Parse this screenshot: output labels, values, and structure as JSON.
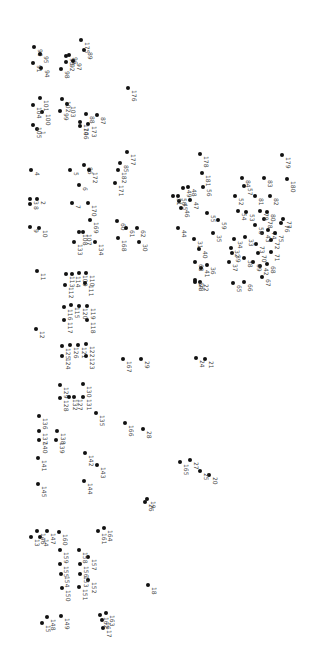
{
  "puzzle": {
    "type": "connect-the-dots",
    "orientation": "rotated-90",
    "dot_color": "#111111",
    "label_color": "#444444",
    "dots": [
      {
        "n": "1",
        "x": 37,
        "y": 129
      },
      {
        "n": "2",
        "x": 37,
        "y": 199
      },
      {
        "n": "3",
        "x": 30,
        "y": 199
      },
      {
        "n": "4",
        "x": 31,
        "y": 170
      },
      {
        "n": "5",
        "x": 70,
        "y": 170
      },
      {
        "n": "6",
        "x": 79,
        "y": 185
      },
      {
        "n": "7",
        "x": 72,
        "y": 203
      },
      {
        "n": "8",
        "x": 30,
        "y": 204
      },
      {
        "n": "9",
        "x": 30,
        "y": 227
      },
      {
        "n": "10",
        "x": 39,
        "y": 228
      },
      {
        "n": "11",
        "x": 37,
        "y": 271
      },
      {
        "n": "12",
        "x": 36,
        "y": 329
      },
      {
        "n": "13",
        "x": 31,
        "y": 537
      },
      {
        "n": "14",
        "x": 40,
        "y": 537
      },
      {
        "n": "15",
        "x": 42,
        "y": 623
      },
      {
        "n": "16",
        "x": 102,
        "y": 620
      },
      {
        "n": "17",
        "x": 103,
        "y": 628
      },
      {
        "n": "18",
        "x": 148,
        "y": 585
      },
      {
        "n": "19",
        "x": 147,
        "y": 499
      },
      {
        "n": "20",
        "x": 209,
        "y": 475
      },
      {
        "n": "21",
        "x": 205,
        "y": 359
      },
      {
        "n": "22",
        "x": 200,
        "y": 282
      },
      {
        "n": "23",
        "x": 195,
        "y": 282
      },
      {
        "n": "24",
        "x": 196,
        "y": 358
      },
      {
        "n": "25",
        "x": 200,
        "y": 471
      },
      {
        "n": "26",
        "x": 145,
        "y": 502
      },
      {
        "n": "27",
        "x": 190,
        "y": 460
      },
      {
        "n": "28",
        "x": 143,
        "y": 429
      },
      {
        "n": "29",
        "x": 141,
        "y": 359
      },
      {
        "n": "30",
        "x": 139,
        "y": 242
      },
      {
        "n": "31",
        "x": 194,
        "y": 239
      },
      {
        "n": "32",
        "x": 231,
        "y": 248
      },
      {
        "n": "33",
        "x": 245,
        "y": 237
      },
      {
        "n": "34",
        "x": 234,
        "y": 239
      },
      {
        "n": "35",
        "x": 213,
        "y": 233
      },
      {
        "n": "36",
        "x": 207,
        "y": 265
      },
      {
        "n": "37",
        "x": 229,
        "y": 262
      },
      {
        "n": "38",
        "x": 244,
        "y": 258
      },
      {
        "n": "39",
        "x": 232,
        "y": 253
      },
      {
        "n": "40",
        "x": 199,
        "y": 249
      },
      {
        "n": "41",
        "x": 201,
        "y": 268
      },
      {
        "n": "42",
        "x": 260,
        "y": 266
      },
      {
        "n": "43",
        "x": 262,
        "y": 233
      },
      {
        "n": "44",
        "x": 178,
        "y": 228
      },
      {
        "n": "45",
        "x": 179,
        "y": 201
      },
      {
        "n": "46",
        "x": 181,
        "y": 208
      },
      {
        "n": "47",
        "x": 190,
        "y": 200
      },
      {
        "n": "48",
        "x": 188,
        "y": 187
      },
      {
        "n": "49",
        "x": 183,
        "y": 188
      },
      {
        "n": "50",
        "x": 178,
        "y": 196
      },
      {
        "n": "51",
        "x": 173,
        "y": 196
      },
      {
        "n": "52",
        "x": 235,
        "y": 196
      },
      {
        "n": "53",
        "x": 246,
        "y": 212
      },
      {
        "n": "54",
        "x": 238,
        "y": 211
      },
      {
        "n": "55",
        "x": 207,
        "y": 213
      },
      {
        "n": "56",
        "x": 203,
        "y": 187
      },
      {
        "n": "57",
        "x": 244,
        "y": 186
      },
      {
        "n": "58",
        "x": 255,
        "y": 225
      },
      {
        "n": "59",
        "x": 218,
        "y": 220
      },
      {
        "n": "60",
        "x": 117,
        "y": 221
      },
      {
        "n": "61",
        "x": 126,
        "y": 228
      },
      {
        "n": "62",
        "x": 137,
        "y": 228
      },
      {
        "n": "63",
        "x": 195,
        "y": 262
      },
      {
        "n": "64",
        "x": 195,
        "y": 280
      },
      {
        "n": "65",
        "x": 233,
        "y": 283
      },
      {
        "n": "66",
        "x": 244,
        "y": 282
      },
      {
        "n": "67",
        "x": 262,
        "y": 277
      },
      {
        "n": "68",
        "x": 267,
        "y": 264
      },
      {
        "n": "69",
        "x": 253,
        "y": 262
      },
      {
        "n": "70",
        "x": 258,
        "y": 253
      },
      {
        "n": "71",
        "x": 271,
        "y": 252
      },
      {
        "n": "72",
        "x": 271,
        "y": 240
      },
      {
        "n": "73",
        "x": 256,
        "y": 244
      },
      {
        "n": "74",
        "x": 268,
        "y": 230
      },
      {
        "n": "75",
        "x": 275,
        "y": 233
      },
      {
        "n": "76",
        "x": 281,
        "y": 223
      },
      {
        "n": "77",
        "x": 283,
        "y": 219
      },
      {
        "n": "78",
        "x": 264,
        "y": 219
      },
      {
        "n": "79",
        "x": 260,
        "y": 211
      },
      {
        "n": "80",
        "x": 267,
        "y": 212
      },
      {
        "n": "81",
        "x": 255,
        "y": 196
      },
      {
        "n": "82",
        "x": 270,
        "y": 196
      },
      {
        "n": "83",
        "x": 264,
        "y": 178
      },
      {
        "n": "84",
        "x": 242,
        "y": 178
      },
      {
        "n": "85",
        "x": 120,
        "y": 163
      },
      {
        "n": "86",
        "x": 84,
        "y": 165
      },
      {
        "n": "87",
        "x": 97,
        "y": 115
      },
      {
        "n": "88",
        "x": 86,
        "y": 114
      },
      {
        "n": "89",
        "x": 84,
        "y": 50
      },
      {
        "n": "90",
        "x": 34,
        "y": 47
      },
      {
        "n": "91",
        "x": 33,
        "y": 63
      },
      {
        "n": "92",
        "x": 66,
        "y": 62
      },
      {
        "n": "93",
        "x": 66,
        "y": 56
      },
      {
        "n": "94",
        "x": 41,
        "y": 68
      },
      {
        "n": "95",
        "x": 40,
        "y": 54
      },
      {
        "n": "96",
        "x": 69,
        "y": 55
      },
      {
        "n": "97",
        "x": 73,
        "y": 61
      },
      {
        "n": "98",
        "x": 61,
        "y": 69
      },
      {
        "n": "99",
        "x": 60,
        "y": 111
      },
      {
        "n": "100",
        "x": 42,
        "y": 112
      },
      {
        "n": "101",
        "x": 40,
        "y": 98
      },
      {
        "n": "102",
        "x": 62,
        "y": 99
      },
      {
        "n": "103",
        "x": 67,
        "y": 104
      },
      {
        "n": "104",
        "x": 33,
        "y": 105
      },
      {
        "n": "105",
        "x": 33,
        "y": 125
      },
      {
        "n": "106",
        "x": 80,
        "y": 126
      },
      {
        "n": "107",
        "x": 83,
        "y": 232
      },
      {
        "n": "108",
        "x": 79,
        "y": 232
      },
      {
        "n": "109",
        "x": 79,
        "y": 273
      },
      {
        "n": "110",
        "x": 86,
        "y": 273
      },
      {
        "n": "111",
        "x": 85,
        "y": 283
      },
      {
        "n": "112",
        "x": 65,
        "y": 285
      },
      {
        "n": "113",
        "x": 66,
        "y": 274
      },
      {
        "n": "114",
        "x": 72,
        "y": 274
      },
      {
        "n": "115",
        "x": 71,
        "y": 305
      },
      {
        "n": "116",
        "x": 64,
        "y": 307
      },
      {
        "n": "117",
        "x": 64,
        "y": 320
      },
      {
        "n": "118",
        "x": 87,
        "y": 320
      },
      {
        "n": "119",
        "x": 87,
        "y": 306
      },
      {
        "n": "120",
        "x": 79,
        "y": 306
      },
      {
        "n": "121",
        "x": 78,
        "y": 345
      },
      {
        "n": "122",
        "x": 86,
        "y": 344
      },
      {
        "n": "123",
        "x": 86,
        "y": 356
      },
      {
        "n": "124",
        "x": 62,
        "y": 356
      },
      {
        "n": "125",
        "x": 62,
        "y": 346
      },
      {
        "n": "126",
        "x": 70,
        "y": 345
      },
      {
        "n": "127",
        "x": 74,
        "y": 397
      },
      {
        "n": "128",
        "x": 60,
        "y": 398
      },
      {
        "n": "129",
        "x": 60,
        "y": 385
      },
      {
        "n": "130",
        "x": 83,
        "y": 384
      },
      {
        "n": "131",
        "x": 83,
        "y": 397
      },
      {
        "n": "132",
        "x": 69,
        "y": 397
      },
      {
        "n": "133",
        "x": 74,
        "y": 242
      },
      {
        "n": "134",
        "x": 95,
        "y": 242
      },
      {
        "n": "135",
        "x": 96,
        "y": 413
      },
      {
        "n": "136",
        "x": 39,
        "y": 416
      },
      {
        "n": "137",
        "x": 39,
        "y": 431
      },
      {
        "n": "138",
        "x": 57,
        "y": 431
      },
      {
        "n": "139",
        "x": 56,
        "y": 440
      },
      {
        "n": "140",
        "x": 39,
        "y": 440
      },
      {
        "n": "141",
        "x": 38,
        "y": 458
      },
      {
        "n": "142",
        "x": 85,
        "y": 453
      },
      {
        "n": "143",
        "x": 97,
        "y": 465
      },
      {
        "n": "144",
        "x": 84,
        "y": 481
      },
      {
        "n": "145",
        "x": 38,
        "y": 484
      },
      {
        "n": "146",
        "x": 37,
        "y": 531
      },
      {
        "n": "147",
        "x": 47,
        "y": 531
      },
      {
        "n": "148",
        "x": 47,
        "y": 617
      },
      {
        "n": "149",
        "x": 61,
        "y": 616
      },
      {
        "n": "150",
        "x": 62,
        "y": 588
      },
      {
        "n": "151",
        "x": 79,
        "y": 587
      },
      {
        "n": "152",
        "x": 88,
        "y": 580
      },
      {
        "n": "153",
        "x": 80,
        "y": 574
      },
      {
        "n": "154",
        "x": 61,
        "y": 574
      },
      {
        "n": "155",
        "x": 60,
        "y": 564
      },
      {
        "n": "156",
        "x": 80,
        "y": 564
      },
      {
        "n": "157",
        "x": 88,
        "y": 557
      },
      {
        "n": "158",
        "x": 79,
        "y": 550
      },
      {
        "n": "159",
        "x": 60,
        "y": 550
      },
      {
        "n": "160",
        "x": 59,
        "y": 532
      },
      {
        "n": "161",
        "x": 98,
        "y": 531
      },
      {
        "n": "162",
        "x": 100,
        "y": 615
      },
      {
        "n": "163",
        "x": 106,
        "y": 613
      },
      {
        "n": "164",
        "x": 104,
        "y": 528
      },
      {
        "n": "165",
        "x": 180,
        "y": 462
      },
      {
        "n": "166",
        "x": 125,
        "y": 423
      },
      {
        "n": "167",
        "x": 123,
        "y": 359
      },
      {
        "n": "168",
        "x": 118,
        "y": 238
      },
      {
        "n": "169",
        "x": 90,
        "y": 220
      },
      {
        "n": "170",
        "x": 88,
        "y": 203
      },
      {
        "n": "171",
        "x": 115,
        "y": 183
      },
      {
        "n": "172",
        "x": 89,
        "y": 170
      },
      {
        "n": "173",
        "x": 88,
        "y": 124
      },
      {
        "n": "174",
        "x": 80,
        "y": 122
      },
      {
        "n": "175",
        "x": 81,
        "y": 40
      },
      {
        "n": "176",
        "x": 128,
        "y": 88
      },
      {
        "n": "177",
        "x": 127,
        "y": 152
      },
      {
        "n": "178",
        "x": 200,
        "y": 154
      },
      {
        "n": "179",
        "x": 282,
        "y": 155
      },
      {
        "n": "180",
        "x": 287,
        "y": 179
      },
      {
        "n": "181",
        "x": 202,
        "y": 173
      },
      {
        "n": "182",
        "x": 118,
        "y": 170
      }
    ]
  }
}
